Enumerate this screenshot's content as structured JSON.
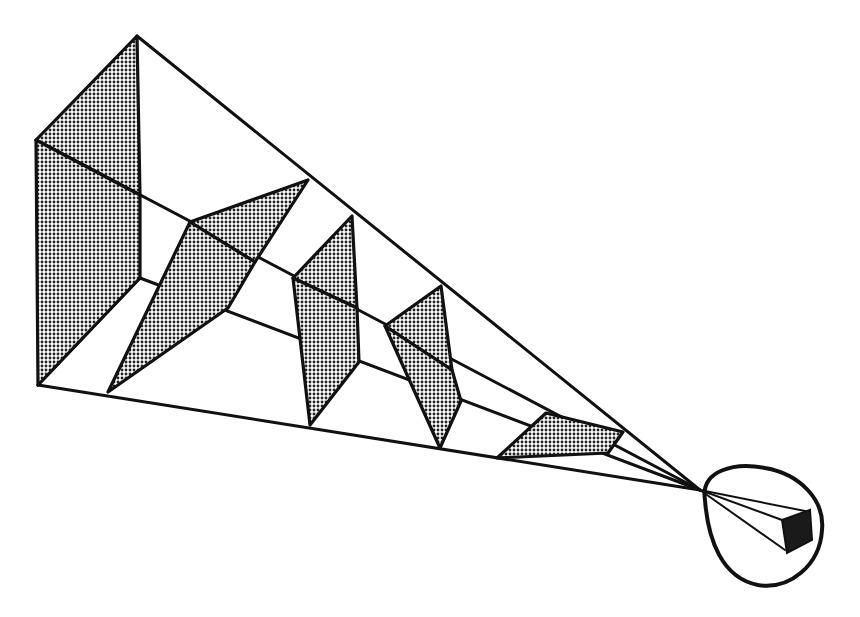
{
  "diagram": {
    "colors": {
      "line": "#111111",
      "shade": "#555555",
      "background": "#ffffff"
    },
    "elements": [
      {
        "name": "near-panel",
        "shaded": true
      },
      {
        "name": "panel-2",
        "shaded": true
      },
      {
        "name": "panel-3",
        "shaded": true
      },
      {
        "name": "panel-4",
        "shaded": true
      },
      {
        "name": "far-panel-floor",
        "shaded": true
      },
      {
        "name": "eye-circle",
        "shaded": false
      },
      {
        "name": "projected-box",
        "shaded": true
      }
    ]
  }
}
